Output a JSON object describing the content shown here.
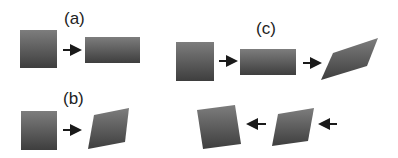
{
  "panels": [
    {
      "id": "a",
      "label": "(a)",
      "description": "square transformed to wider rectangle"
    },
    {
      "id": "b",
      "label": "(b)",
      "description": "square transformed to parallelogram (shear)"
    },
    {
      "id": "c",
      "label": "(c)",
      "description": "square to rectangle to parallelogram, then reversed to rotated squares"
    }
  ],
  "colors": {
    "shape_top": "#7a7a7a",
    "shape_bottom": "#3f3f3f",
    "arrow": "#1a1a1a",
    "label": "#222222"
  }
}
